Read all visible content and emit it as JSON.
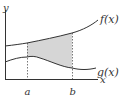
{
  "diagram": {
    "y_axis_label": "y",
    "x_axis_label": "x",
    "curves": [
      {
        "name": "f",
        "label": "f(x)"
      },
      {
        "name": "g",
        "label": "g(x)"
      }
    ],
    "bounds": [
      {
        "name": "a",
        "label": "a"
      },
      {
        "name": "b",
        "label": "b"
      }
    ],
    "colors": {
      "stroke": "#333333",
      "shade": "#d9d9d9",
      "dashed": "#666666"
    }
  }
}
